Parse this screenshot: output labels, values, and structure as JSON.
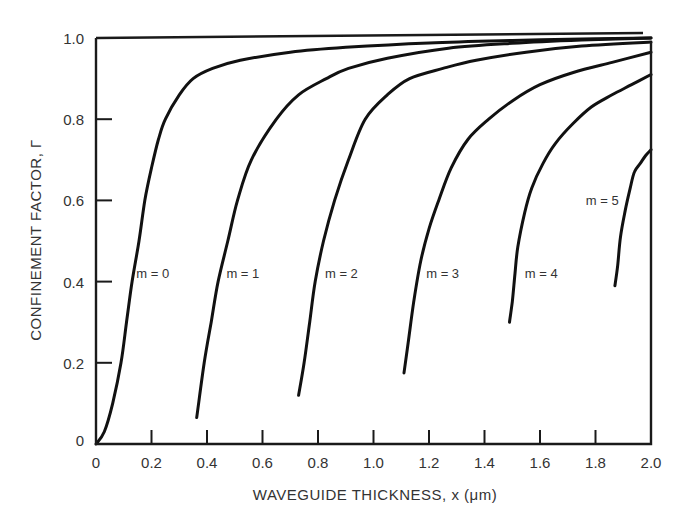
{
  "chart_data": {
    "type": "line",
    "title": "",
    "xlabel": "WAVEGUIDE THICKNESS, x (μm)",
    "ylabel": "CONFINEMENT FACTOR, Γ",
    "xlim": [
      0,
      2.0
    ],
    "ylim": [
      0,
      1.0
    ],
    "grid": false,
    "legend": "inline curve labels",
    "x_ticks": [
      0,
      0.2,
      0.4,
      0.6,
      0.8,
      1.0,
      1.2,
      1.4,
      1.6,
      1.8,
      2.0
    ],
    "x_tick_labels": [
      "0",
      "0.2",
      "0.4",
      "0.6",
      "0.8",
      "1.0",
      "1.2",
      "1.4",
      "1.6",
      "1.8",
      "2.0"
    ],
    "y_ticks": [
      0,
      0.2,
      0.4,
      0.6,
      0.8,
      1.0
    ],
    "y_tick_labels": [
      "0",
      "0.2",
      "0.4",
      "0.6",
      "0.8",
      "1.0"
    ],
    "series": [
      {
        "name": "m = 0",
        "label_pos": [
          0.145,
          0.42
        ],
        "x": [
          0.0,
          0.03,
          0.06,
          0.09,
          0.11,
          0.13,
          0.155,
          0.176,
          0.2,
          0.225,
          0.25,
          0.3,
          0.35,
          0.42,
          0.52,
          0.7,
          0.9,
          1.2,
          1.5,
          1.8,
          2.0
        ],
        "y": [
          0.0,
          0.03,
          0.1,
          0.2,
          0.3,
          0.4,
          0.5,
          0.6,
          0.68,
          0.75,
          0.8,
          0.86,
          0.9,
          0.925,
          0.945,
          0.965,
          0.977,
          0.988,
          0.994,
          0.998,
          1.0
        ]
      },
      {
        "name": "m = 1",
        "label_pos": [
          0.47,
          0.42
        ],
        "x": [
          0.363,
          0.39,
          0.415,
          0.44,
          0.475,
          0.51,
          0.56,
          0.65,
          0.73,
          0.83,
          0.91,
          1.05,
          1.27,
          1.5,
          1.75,
          2.0
        ],
        "y": [
          0.065,
          0.2,
          0.3,
          0.4,
          0.5,
          0.6,
          0.7,
          0.8,
          0.86,
          0.9,
          0.925,
          0.95,
          0.975,
          0.987,
          0.995,
          1.0
        ]
      },
      {
        "name": "m = 2",
        "label_pos": [
          0.825,
          0.42
        ],
        "x": [
          0.73,
          0.75,
          0.77,
          0.79,
          0.82,
          0.86,
          0.91,
          0.97,
          1.05,
          1.13,
          1.25,
          1.37,
          1.55,
          1.75,
          2.0
        ],
        "y": [
          0.12,
          0.2,
          0.3,
          0.4,
          0.5,
          0.6,
          0.7,
          0.8,
          0.86,
          0.9,
          0.925,
          0.945,
          0.965,
          0.98,
          0.99
        ]
      },
      {
        "name": "m = 3",
        "label_pos": [
          1.19,
          0.42
        ],
        "x": [
          1.11,
          1.125,
          1.145,
          1.17,
          1.2,
          1.235,
          1.28,
          1.34,
          1.415,
          1.5,
          1.6,
          1.72,
          1.86,
          2.0
        ],
        "y": [
          0.175,
          0.25,
          0.35,
          0.45,
          0.53,
          0.6,
          0.68,
          0.75,
          0.8,
          0.845,
          0.885,
          0.915,
          0.94,
          0.965
        ]
      },
      {
        "name": "m = 4",
        "label_pos": [
          1.545,
          0.42
        ],
        "x": [
          1.49,
          1.5,
          1.51,
          1.52,
          1.545,
          1.57,
          1.61,
          1.655,
          1.72,
          1.785,
          1.86,
          1.93,
          2.0
        ],
        "y": [
          0.3,
          0.35,
          0.42,
          0.485,
          0.57,
          0.63,
          0.69,
          0.74,
          0.79,
          0.83,
          0.86,
          0.885,
          0.91
        ]
      },
      {
        "name": "m = 5",
        "label_pos": [
          1.765,
          0.6
        ],
        "x": [
          1.87,
          1.88,
          1.89,
          1.907,
          1.925,
          1.94,
          1.96,
          1.98,
          2.0
        ],
        "y": [
          0.39,
          0.44,
          0.51,
          0.575,
          0.63,
          0.67,
          0.69,
          0.71,
          0.725
        ]
      }
    ]
  }
}
